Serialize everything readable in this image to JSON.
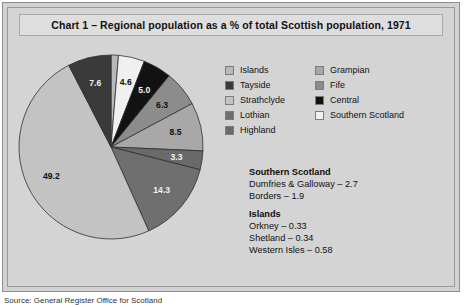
{
  "figure": {
    "title": "Chart 1 – Regional population as a % of total Scottish population, 1971",
    "source": "Source: General Register Office for Scotland"
  },
  "legend": {
    "column_left": [
      {
        "label": "Islands",
        "color": "#b9b9b9"
      },
      {
        "label": "Tayside",
        "color": "#3a3a3a"
      },
      {
        "label": "Strathclyde",
        "color": "#c3c3c3"
      },
      {
        "label": "Lothian",
        "color": "#6f6f6f"
      },
      {
        "label": "Highland",
        "color": "#6a6a6a"
      }
    ],
    "column_right": [
      {
        "label": "Grampian",
        "color": "#a8a8a8"
      },
      {
        "label": "Fife",
        "color": "#8c8c8c"
      },
      {
        "label": "Central",
        "color": "#121212"
      },
      {
        "label": "Southern Scotland",
        "color": "#f0f0f0"
      }
    ]
  },
  "notes": [
    {
      "heading": "Southern Scotland",
      "lines": [
        "Dumfries & Galloway – 2.7",
        "Borders – 1.9"
      ]
    },
    {
      "heading": "Islands",
      "lines": [
        "Orkney – 0.33",
        "Shetland – 0.34",
        "Western Isles – 0.58"
      ]
    }
  ],
  "chart_data": {
    "type": "pie",
    "title": "Chart 1 – Regional population as a % of total Scottish population, 1971",
    "unit": "% of total Scottish population",
    "start_angle_deg": 0,
    "direction": "clockwise",
    "legend_position": "right",
    "categories": [
      "Islands",
      "Southern Scotland",
      "Central",
      "Fife",
      "Grampian",
      "Highland",
      "Lothian",
      "Strathclyde",
      "Tayside"
    ],
    "values": [
      1.3,
      4.6,
      5.0,
      6.3,
      8.5,
      3.3,
      14.3,
      49.2,
      7.6
    ],
    "slices": [
      {
        "label": "Islands",
        "value": 1.3,
        "color": "#b9b9b9",
        "label_on_dark": false
      },
      {
        "label": "Southern Scotland",
        "value": 4.6,
        "color": "#f0f0f0",
        "label_on_dark": false
      },
      {
        "label": "Central",
        "value": 5.0,
        "color": "#121212",
        "label_on_dark": true
      },
      {
        "label": "Fife",
        "value": 6.3,
        "color": "#8c8c8c",
        "label_on_dark": false
      },
      {
        "label": "Grampian",
        "value": 8.5,
        "color": "#a8a8a8",
        "label_on_dark": false
      },
      {
        "label": "Highland",
        "value": 3.3,
        "color": "#6a6a6a",
        "label_on_dark": true
      },
      {
        "label": "Lothian",
        "value": 14.3,
        "color": "#6f6f6f",
        "label_on_dark": true
      },
      {
        "label": "Strathclyde",
        "value": 49.2,
        "color": "#c3c3c3",
        "label_on_dark": false
      },
      {
        "label": "Tayside",
        "value": 7.6,
        "color": "#3a3a3a",
        "label_on_dark": true
      }
    ]
  }
}
